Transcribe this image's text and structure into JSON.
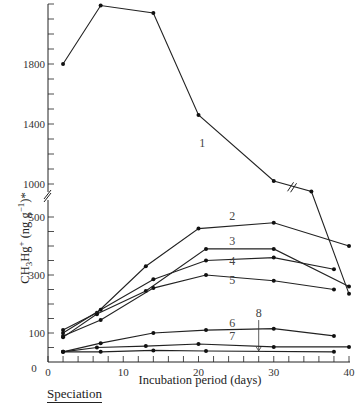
{
  "chart_data": {
    "type": "line",
    "title": "",
    "xlabel": "Incubation period (days)",
    "ylabel": "CH3Hg+ (ng g-1)*",
    "ylabel_parts": {
      "main": "CH",
      "sub1": "3",
      "mid": "Hg",
      "sup1": "+",
      "rest": " (ng g",
      "sup2": "−1",
      "end": ")*"
    },
    "xlim": [
      0,
      40
    ],
    "ylim": [
      0,
      2200
    ],
    "y_axis_break": {
      "between": [
        500,
        1000
      ]
    },
    "x_ticks": [
      0,
      10,
      20,
      30,
      40
    ],
    "x_minor_step": 2,
    "y_ticks_lower": [
      100,
      300,
      500
    ],
    "y_ticks_upper": [
      1000,
      1400,
      1800
    ],
    "grid": false,
    "legend": "inline numeric labels 1–8",
    "series": [
      {
        "name": "1",
        "x": [
          2,
          7,
          14,
          20,
          30,
          35,
          40
        ],
        "y": [
          1800,
          2190,
          2140,
          1460,
          1020,
          950,
          235
        ],
        "label_pos": [
          20.5,
          1250
        ]
      },
      {
        "name": "2",
        "x": [
          2,
          6.5,
          13,
          20,
          30,
          40
        ],
        "y": [
          110,
          170,
          330,
          460,
          480,
          400
        ],
        "label_pos": [
          24.5,
          490
        ]
      },
      {
        "name": "3",
        "x": [
          2,
          6.5,
          13,
          21,
          30,
          40
        ],
        "y": [
          85,
          165,
          245,
          390,
          390,
          260
        ],
        "label_pos": [
          24.5,
          405
        ]
      },
      {
        "name": "4",
        "x": [
          2,
          7,
          14,
          21,
          30,
          38
        ],
        "y": [
          100,
          180,
          285,
          350,
          360,
          320
        ],
        "label_pos": [
          24.5,
          335
        ]
      },
      {
        "name": "5",
        "x": [
          2,
          7,
          14,
          21,
          30,
          38
        ],
        "y": [
          90,
          145,
          255,
          300,
          280,
          250
        ],
        "label_pos": [
          24.5,
          270
        ]
      },
      {
        "name": "6",
        "x": [
          2,
          7,
          14,
          21,
          30,
          38
        ],
        "y": [
          35,
          65,
          100,
          110,
          115,
          90
        ],
        "label_pos": [
          24.5,
          120
        ]
      },
      {
        "name": "7",
        "x": [
          2,
          6.5,
          13,
          20,
          30,
          40
        ],
        "y": [
          35,
          50,
          55,
          62,
          52,
          52
        ],
        "label_pos": [
          24.5,
          75
        ]
      },
      {
        "name": "8",
        "x": [
          2,
          7,
          14,
          21,
          38
        ],
        "y": [
          35,
          35,
          40,
          38,
          35
        ],
        "label_pos": [
          28,
          155
        ],
        "arrow_to": [
          28,
          35
        ]
      }
    ]
  },
  "footer": {
    "heading": "Speciation"
  }
}
